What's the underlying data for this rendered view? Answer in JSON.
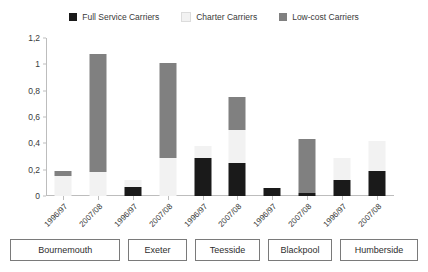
{
  "chart_data": {
    "type": "bar",
    "subtype": "stacked-bar",
    "title": "",
    "xlabel": "",
    "ylabel": "",
    "ylim": [
      0,
      1.2
    ],
    "ytick_values": [
      0,
      0.2,
      0.4,
      0.6,
      0.8,
      1.0,
      1.2
    ],
    "ytick_labels": [
      "0",
      "0,2",
      "0,4",
      "0,6",
      "0,8",
      "1",
      "1,2"
    ],
    "grid": false,
    "legend_position": "top-center",
    "decimal_separator": ",",
    "categories": [
      "1996/97",
      "2007/08",
      "1996/97",
      "2007/08",
      "1996/97",
      "2007/08",
      "1996/97",
      "2007/08",
      "1996/97",
      "2007/08"
    ],
    "groups": [
      {
        "label": "Bournemouth",
        "categories": [
          "1996/97",
          "2007/08"
        ]
      },
      {
        "label": "Exeter",
        "categories": [
          "1996/97",
          "2007/08"
        ]
      },
      {
        "label": "Teesside",
        "categories": [
          "1996/97",
          "2007/08"
        ]
      },
      {
        "label": "Blackpool",
        "categories": [
          "1996/97",
          "2007/08"
        ]
      },
      {
        "label": "Humberside",
        "categories": [
          "1996/97",
          "2007/08"
        ]
      }
    ],
    "series": [
      {
        "name": "Full Service Carriers",
        "color": "#1a1a1a",
        "values": [
          0.0,
          0.0,
          0.07,
          0.0,
          0.29,
          0.25,
          0.06,
          0.02,
          0.12,
          0.19
        ]
      },
      {
        "name": "Charter Carriers",
        "color": "#f2f2f2",
        "values": [
          0.15,
          0.18,
          0.05,
          0.29,
          0.09,
          0.25,
          0.0,
          0.0,
          0.17,
          0.23
        ]
      },
      {
        "name": "Low-cost Carriers",
        "color": "#808080",
        "values": [
          0.04,
          0.9,
          0.0,
          0.72,
          0.0,
          0.25,
          0.0,
          0.41,
          0.0,
          0.0
        ]
      }
    ],
    "totals": [
      0.19,
      1.08,
      0.12,
      1.01,
      0.38,
      0.75,
      0.06,
      0.43,
      0.29,
      0.42
    ]
  },
  "legend": {
    "items": [
      {
        "label": "Full Service Carriers",
        "color": "#1a1a1a"
      },
      {
        "label": "Charter Carriers",
        "color": "#f2f2f2"
      },
      {
        "label": "Low-cost Carriers",
        "color": "#808080"
      }
    ]
  }
}
